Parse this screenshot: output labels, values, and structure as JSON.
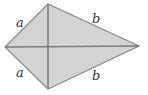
{
  "diagram": {
    "type": "kite",
    "fill_color": "#d4d4d4",
    "stroke_color": "#7a7a7a",
    "vertices": {
      "left": [
        5,
        47
      ],
      "top": [
        48,
        4
      ],
      "right": [
        139,
        46
      ],
      "bottom": [
        48,
        89
      ]
    },
    "labels": {
      "top_left": "a",
      "bottom_left": "a",
      "top_right": "b",
      "bottom_right": "b"
    }
  }
}
